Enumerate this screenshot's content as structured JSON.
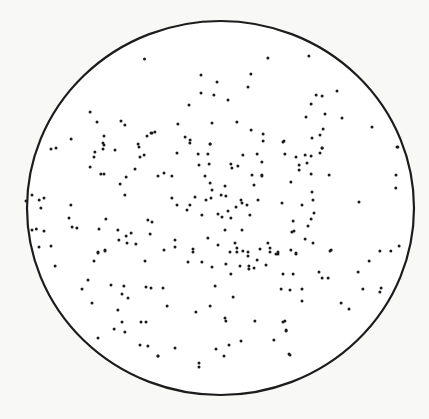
{
  "figure": {
    "colors": {
      "background": "#f8f8f6",
      "field": "#ffffff",
      "ink": "#1a1a1a",
      "outline": "#1c1c1c"
    },
    "field_shape": "circle",
    "dot_count_note": "points given in unit-disc coordinates: x right, y down, range -1..1",
    "points": [
      [
        -0.393,
        -0.797
      ],
      [
        0.245,
        -0.802
      ],
      [
        -0.101,
        -0.711
      ],
      [
        0.157,
        -0.717
      ],
      [
        -0.018,
        -0.674
      ],
      [
        0.142,
        -0.647
      ],
      [
        -0.101,
        -0.615
      ],
      [
        -0.034,
        -0.604
      ],
      [
        0.039,
        -0.578
      ],
      [
        -0.163,
        -0.551
      ],
      [
        -0.22,
        -0.449
      ],
      [
        -0.044,
        -0.455
      ],
      [
        0.085,
        -0.46
      ],
      [
        0.158,
        -0.417
      ],
      [
        -0.354,
        -0.401
      ],
      [
        -0.339,
        -0.406
      ],
      [
        -0.183,
        -0.38
      ],
      [
        -0.157,
        -0.364
      ],
      [
        -0.054,
        -0.342
      ],
      [
        0.22,
        -0.396
      ],
      [
        0.22,
        -0.358
      ],
      [
        0.328,
        -0.358
      ],
      [
        -0.674,
        -0.513
      ],
      [
        -0.638,
        -0.46
      ],
      [
        -0.514,
        -0.465
      ],
      [
        -0.494,
        -0.444
      ],
      [
        -0.772,
        -0.369
      ],
      [
        -0.602,
        -0.385
      ],
      [
        -0.602,
        -0.337
      ],
      [
        -0.359,
        -0.401
      ],
      [
        -0.38,
        -0.385
      ],
      [
        0.457,
        -0.813
      ],
      [
        0.602,
        -0.626
      ],
      [
        0.494,
        -0.604
      ],
      [
        0.525,
        -0.599
      ],
      [
        0.468,
        -0.556
      ],
      [
        0.442,
        -0.487
      ],
      [
        0.54,
        -0.503
      ],
      [
        0.628,
        -0.481
      ],
      [
        0.53,
        -0.423
      ],
      [
        0.514,
        -0.39
      ],
      [
        0.473,
        -0.374
      ],
      [
        0.783,
        -0.433
      ],
      [
        0.917,
        -0.326
      ],
      [
        0.525,
        -0.321
      ],
      [
        -0.876,
        -0.316
      ],
      [
        -0.85,
        -0.321
      ],
      [
        -0.607,
        -0.348
      ],
      [
        -0.649,
        -0.299
      ],
      [
        -0.607,
        -0.315
      ],
      [
        -0.545,
        -0.31
      ],
      [
        -0.426,
        -0.342
      ],
      [
        -0.421,
        -0.326
      ],
      [
        -0.395,
        -0.283
      ],
      [
        -0.654,
        -0.273
      ],
      [
        -0.674,
        -0.219
      ],
      [
        -0.618,
        -0.182
      ],
      [
        -0.602,
        -0.182
      ],
      [
        -0.416,
        -0.273
      ],
      [
        -0.323,
        -0.171
      ],
      [
        -0.519,
        -0.128
      ],
      [
        -0.488,
        -0.166
      ],
      [
        -0.442,
        -0.209
      ],
      [
        -0.494,
        -0.07
      ],
      [
        -0.974,
        -0.07
      ],
      [
        -1.005,
        -0.037
      ],
      [
        -0.912,
        -0.053
      ],
      [
        -0.928,
        0.0
      ],
      [
        -0.773,
        -0.016
      ],
      [
        -0.783,
        0.053
      ],
      [
        -0.592,
        0.059
      ],
      [
        -0.742,
        0.107
      ],
      [
        -0.628,
        0.112
      ],
      [
        -0.53,
        0.118
      ],
      [
        -0.462,
        0.134
      ],
      [
        -0.488,
        0.15
      ],
      [
        -0.483,
        0.187
      ],
      [
        -0.525,
        0.171
      ],
      [
        -0.974,
        0.118
      ],
      [
        -0.912,
        0.123
      ],
      [
        -0.938,
        0.209
      ],
      [
        -0.876,
        0.203
      ],
      [
        -0.633,
        0.241
      ],
      [
        -0.597,
        0.225
      ],
      [
        -0.437,
        0.193
      ],
      [
        -0.354,
        0.075
      ],
      [
        -0.375,
        0.064
      ],
      [
        -0.364,
        0.139
      ],
      [
        -0.158,
        -0.348
      ],
      [
        -0.054,
        -0.342
      ],
      [
        -0.225,
        -0.294
      ],
      [
        -0.116,
        -0.289
      ],
      [
        -0.065,
        -0.289
      ],
      [
        -0.059,
        -0.235
      ],
      [
        0.116,
        -0.283
      ],
      [
        0.189,
        -0.289
      ],
      [
        0.214,
        -0.246
      ],
      [
        -0.111,
        -0.23
      ],
      [
        0.054,
        -0.235
      ],
      [
        0.059,
        -0.214
      ],
      [
        0.09,
        -0.225
      ],
      [
        0.214,
        -0.176
      ],
      [
        0.163,
        -0.176
      ],
      [
        -0.08,
        -0.171
      ],
      [
        -0.054,
        -0.134
      ],
      [
        0.023,
        -0.118
      ],
      [
        0.173,
        -0.123
      ],
      [
        0.214,
        -0.171
      ],
      [
        -0.251,
        -0.171
      ],
      [
        -0.292,
        -0.187
      ],
      [
        -0.044,
        -0.096
      ],
      [
        -0.049,
        -0.053
      ],
      [
        -0.251,
        -0.053
      ],
      [
        -0.225,
        -0.016
      ],
      [
        -0.173,
        0.011
      ],
      [
        -0.158,
        -0.016
      ],
      [
        -0.132,
        -0.059
      ],
      [
        -0.075,
        -0.043
      ],
      [
        0.003,
        -0.07
      ],
      [
        0.028,
        -0.064
      ],
      [
        0.08,
        -0.005
      ],
      [
        0.039,
        0.016
      ],
      [
        0.137,
        -0.016
      ],
      [
        0.194,
        -0.043
      ],
      [
        0.106,
        -0.043
      ],
      [
        0.111,
        -0.027
      ],
      [
        0.008,
        0.048
      ],
      [
        -0.013,
        0.032
      ],
      [
        0.054,
        0.053
      ],
      [
        0.152,
        0.037
      ],
      [
        0.111,
        0.118
      ],
      [
        0.023,
        0.118
      ],
      [
        -0.096,
        0.037
      ],
      [
        -0.013,
        0.198
      ],
      [
        0.075,
        0.187
      ],
      [
        0.085,
        0.214
      ],
      [
        -0.065,
        0.16
      ],
      [
        -0.235,
        0.171
      ],
      [
        -0.235,
        0.209
      ],
      [
        -0.292,
        0.225
      ],
      [
        -0.142,
        0.219
      ],
      [
        0.049,
        0.235
      ],
      [
        0.142,
        0.235
      ],
      [
        0.142,
        0.257
      ],
      [
        0.256,
        0.214
      ],
      [
        0.256,
        0.235
      ],
      [
        0.245,
        0.187
      ],
      [
        0.189,
        0.278
      ],
      [
        0.287,
        0.246
      ],
      [
        0.297,
        0.235
      ],
      [
        0.323,
        -0.353
      ],
      [
        0.525,
        -0.321
      ],
      [
        0.333,
        -0.289
      ],
      [
        0.39,
        -0.273
      ],
      [
        0.437,
        -0.283
      ],
      [
        0.468,
        -0.278
      ],
      [
        0.514,
        -0.294
      ],
      [
        0.406,
        -0.23
      ],
      [
        0.447,
        -0.241
      ],
      [
        0.406,
        -0.203
      ],
      [
        0.468,
        -0.182
      ],
      [
        0.561,
        -0.176
      ],
      [
        0.364,
        -0.139
      ],
      [
        0.912,
        -0.326
      ],
      [
        0.907,
        -0.176
      ],
      [
        0.473,
        -0.086
      ],
      [
        0.478,
        -0.043
      ],
      [
        0.318,
        -0.027
      ],
      [
        0.421,
        -0.016
      ],
      [
        0.716,
        -0.032
      ],
      [
        0.483,
        0.027
      ],
      [
        0.468,
        0.059
      ],
      [
        0.375,
        0.07
      ],
      [
        0.452,
        0.096
      ],
      [
        0.38,
        0.123
      ],
      [
        0.369,
        0.128
      ],
      [
        0.437,
        0.166
      ],
      [
        0.478,
        0.187
      ],
      [
        0.572,
        0.225
      ],
      [
        0.824,
        0.23
      ],
      [
        0.923,
        0.203
      ],
      [
        0.39,
        0.241
      ],
      [
        -0.633,
        0.235
      ],
      [
        -0.597,
        0.23
      ],
      [
        -0.654,
        0.283
      ],
      [
        -0.855,
        0.31
      ],
      [
        -0.685,
        0.385
      ],
      [
        -0.716,
        0.433
      ],
      [
        -0.566,
        0.412
      ],
      [
        -0.509,
        0.46
      ],
      [
        -0.478,
        0.481
      ],
      [
        -0.664,
        0.508
      ],
      [
        -0.53,
        0.545
      ],
      [
        -0.499,
        0.417
      ],
      [
        -0.385,
        0.422
      ],
      [
        -0.39,
        0.283
      ],
      [
        -0.385,
        0.61
      ],
      [
        -0.411,
        0.61
      ],
      [
        -0.509,
        0.61
      ],
      [
        -0.55,
        0.647
      ],
      [
        -0.633,
        0.695
      ],
      [
        -0.494,
        0.663
      ],
      [
        -0.416,
        0.733
      ],
      [
        -0.375,
        0.738
      ],
      [
        -0.323,
        0.791
      ],
      [
        -0.142,
        0.235
      ],
      [
        0.085,
        0.235
      ],
      [
        -0.168,
        0.289
      ],
      [
        -0.096,
        0.289
      ],
      [
        -0.044,
        0.316
      ],
      [
        0.028,
        0.299
      ],
      [
        0.147,
        0.31
      ],
      [
        0.101,
        0.31
      ],
      [
        0.147,
        0.326
      ],
      [
        0.173,
        0.321
      ],
      [
        0.235,
        0.305
      ],
      [
        0.297,
        0.246
      ],
      [
        0.204,
        0.219
      ],
      [
        0.116,
        0.23
      ],
      [
        0.054,
        0.353
      ],
      [
        -0.028,
        0.417
      ],
      [
        -0.297,
        0.428
      ],
      [
        -0.276,
        0.524
      ],
      [
        -0.054,
        0.524
      ],
      [
        -0.127,
        0.556
      ],
      [
        0.023,
        0.588
      ],
      [
        0.028,
        0.604
      ],
      [
        -0.359,
        0.428
      ],
      [
        0.065,
        0.476
      ],
      [
        0.106,
        0.711
      ],
      [
        0.178,
        0.604
      ],
      [
        0.044,
        0.733
      ],
      [
        -0.235,
        0.749
      ],
      [
        0.018,
        0.791
      ],
      [
        -0.023,
        0.754
      ],
      [
        -0.111,
        0.829
      ],
      [
        -0.111,
        0.85
      ],
      [
        -0.323,
        0.791
      ],
      [
        0.323,
        0.61
      ],
      [
        0.339,
        0.652
      ],
      [
        0.276,
        0.706
      ],
      [
        0.359,
        0.786
      ],
      [
        0.39,
        0.246
      ],
      [
        0.364,
        0.225
      ],
      [
        0.566,
        0.23
      ],
      [
        0.768,
        0.283
      ],
      [
        0.323,
        0.353
      ],
      [
        0.375,
        0.353
      ],
      [
        0.509,
        0.342
      ],
      [
        0.525,
        0.374
      ],
      [
        0.556,
        0.374
      ],
      [
        0.711,
        0.342
      ],
      [
        0.313,
        0.433
      ],
      [
        0.359,
        0.439
      ],
      [
        0.421,
        0.433
      ],
      [
        0.421,
        0.497
      ],
      [
        0.736,
        0.433
      ],
      [
        0.83,
        0.428
      ],
      [
        0.824,
        0.449
      ],
      [
        0.623,
        0.508
      ],
      [
        0.664,
        0.54
      ],
      [
        0.333,
        0.604
      ],
      [
        0.339,
        0.658
      ],
      [
        0.354,
        0.781
      ],
      [
        -0.937,
        -0.043
      ],
      [
        -0.952,
        0.112
      ],
      [
        -0.767,
        0.102
      ],
      [
        0.906,
        -0.107
      ],
      [
        0.88,
        0.23
      ]
    ]
  }
}
